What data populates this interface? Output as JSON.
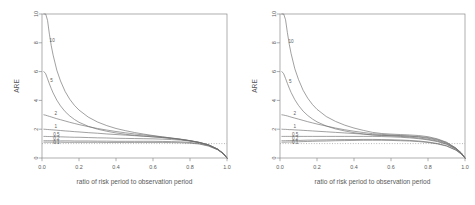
{
  "figure": {
    "panel_count": 2,
    "background": "#ffffff",
    "axis_color": "#8c8c8c",
    "curve_color": "#6e6e6e",
    "refline_color": "#9a9a9a"
  },
  "chart_data": [
    {
      "type": "line",
      "panel": "left",
      "title": "",
      "xlabel": "ratio of risk period to observation period",
      "ylabel": "ARE",
      "xlim": [
        0.0,
        1.0
      ],
      "ylim": [
        0.0,
        10.0
      ],
      "xticks": [
        0.0,
        0.2,
        0.4,
        0.6,
        0.8,
        1.0
      ],
      "xticklabels": [
        "0.0",
        "0.2",
        "0.4",
        "0.6",
        "0.8",
        "1.0"
      ],
      "yticks": [
        0,
        2,
        4,
        6,
        8,
        10
      ],
      "yticklabels": [
        "0",
        "2",
        "4",
        "6",
        "8",
        "10"
      ],
      "grid": false,
      "legend": "inline-curve-labels",
      "reference_lines": [
        {
          "axis": "y",
          "value": 1,
          "style": "dotted"
        }
      ],
      "x": [
        0.01,
        0.02,
        0.03,
        0.04,
        0.05,
        0.06,
        0.08,
        0.1,
        0.125,
        0.15,
        0.175,
        0.2,
        0.25,
        0.3,
        0.35,
        0.4,
        0.45,
        0.5,
        0.55,
        0.6,
        0.65,
        0.7,
        0.75,
        0.8,
        0.85,
        0.9,
        0.95,
        0.98,
        1.0
      ],
      "series": [
        {
          "name": "10",
          "label": "10",
          "label_x": 0.055,
          "label_y": 8.15,
          "values": [
            10.0,
            10.0,
            9.55,
            8.6,
            7.8,
            7.15,
            6.1,
            5.35,
            4.62,
            4.08,
            3.66,
            3.33,
            2.84,
            2.5,
            2.25,
            2.05,
            1.9,
            1.77,
            1.66,
            1.56,
            1.47,
            1.38,
            1.29,
            1.19,
            1.07,
            0.9,
            0.6,
            0.3,
            0.0
          ]
        },
        {
          "name": "5",
          "label": "5",
          "label_x": 0.052,
          "label_y": 5.35,
          "values": [
            6.0,
            5.85,
            5.5,
            5.15,
            4.82,
            4.52,
            4.02,
            3.62,
            3.22,
            2.92,
            2.68,
            2.48,
            2.2,
            2.0,
            1.86,
            1.74,
            1.65,
            1.58,
            1.52,
            1.47,
            1.42,
            1.36,
            1.29,
            1.2,
            1.08,
            0.91,
            0.61,
            0.31,
            0.0
          ]
        },
        {
          "name": "2",
          "label": "2",
          "label_x": 0.075,
          "label_y": 3.1,
          "values": [
            3.0,
            2.97,
            2.93,
            2.89,
            2.85,
            2.81,
            2.73,
            2.66,
            2.57,
            2.48,
            2.4,
            2.32,
            2.18,
            2.05,
            1.94,
            1.84,
            1.75,
            1.67,
            1.6,
            1.53,
            1.46,
            1.39,
            1.31,
            1.21,
            1.09,
            0.92,
            0.62,
            0.32,
            0.0
          ]
        },
        {
          "name": "1",
          "label": "1",
          "label_x": 0.075,
          "label_y": 2.22,
          "values": [
            2.0,
            1.99,
            1.98,
            1.97,
            1.96,
            1.95,
            1.93,
            1.91,
            1.88,
            1.86,
            1.83,
            1.81,
            1.76,
            1.72,
            1.67,
            1.63,
            1.59,
            1.55,
            1.51,
            1.47,
            1.42,
            1.36,
            1.29,
            1.2,
            1.08,
            0.91,
            0.61,
            0.31,
            0.0
          ]
        },
        {
          "name": "0.5",
          "label": "0.5",
          "label_x": 0.078,
          "label_y": 1.62,
          "values": [
            1.5,
            1.5,
            1.49,
            1.49,
            1.49,
            1.48,
            1.48,
            1.47,
            1.46,
            1.45,
            1.44,
            1.44,
            1.42,
            1.4,
            1.39,
            1.37,
            1.36,
            1.35,
            1.34,
            1.33,
            1.31,
            1.28,
            1.24,
            1.17,
            1.07,
            0.9,
            0.6,
            0.3,
            0.0
          ]
        },
        {
          "name": "0.2",
          "label": "0.2",
          "label_x": 0.078,
          "label_y": 1.35,
          "values": [
            1.2,
            1.2,
            1.2,
            1.2,
            1.2,
            1.2,
            1.19,
            1.19,
            1.19,
            1.19,
            1.18,
            1.18,
            1.18,
            1.17,
            1.17,
            1.16,
            1.16,
            1.16,
            1.16,
            1.16,
            1.15,
            1.14,
            1.12,
            1.08,
            1.0,
            0.85,
            0.58,
            0.29,
            0.0
          ]
        },
        {
          "name": "0.1",
          "label": "0.1",
          "label_x": 0.078,
          "label_y": 1.05,
          "values": [
            1.1,
            1.1,
            1.1,
            1.1,
            1.1,
            1.1,
            1.1,
            1.1,
            1.09,
            1.09,
            1.09,
            1.09,
            1.09,
            1.09,
            1.08,
            1.08,
            1.08,
            1.08,
            1.08,
            1.08,
            1.08,
            1.07,
            1.06,
            1.03,
            0.97,
            0.83,
            0.57,
            0.29,
            0.0
          ]
        }
      ]
    },
    {
      "type": "line",
      "panel": "right",
      "title": "",
      "xlabel": "ratio of risk period to observation period",
      "ylabel": "ARE",
      "xlim": [
        0.0,
        1.0
      ],
      "ylim": [
        0.0,
        10.0
      ],
      "xticks": [
        0.0,
        0.2,
        0.4,
        0.6,
        0.8,
        1.0
      ],
      "xticklabels": [
        "0.0",
        "0.2",
        "0.4",
        "0.6",
        "0.8",
        "1.0"
      ],
      "yticks": [
        0,
        2,
        4,
        6,
        8,
        10
      ],
      "yticklabels": [
        "0",
        "2",
        "4",
        "6",
        "8",
        "10"
      ],
      "grid": false,
      "legend": "inline-curve-labels",
      "reference_lines": [
        {
          "axis": "y",
          "value": 1,
          "style": "dotted"
        }
      ],
      "x": [
        0.01,
        0.02,
        0.03,
        0.04,
        0.05,
        0.06,
        0.08,
        0.1,
        0.125,
        0.15,
        0.175,
        0.2,
        0.25,
        0.3,
        0.35,
        0.4,
        0.45,
        0.5,
        0.55,
        0.6,
        0.65,
        0.7,
        0.75,
        0.8,
        0.85,
        0.9,
        0.95,
        0.98,
        1.0
      ],
      "series": [
        {
          "name": "10",
          "label": "10",
          "label_x": 0.06,
          "label_y": 8.1,
          "values": [
            10.0,
            10.0,
            9.6,
            8.7,
            7.9,
            7.25,
            6.2,
            5.45,
            4.7,
            4.15,
            3.72,
            3.38,
            2.88,
            2.54,
            2.28,
            2.08,
            1.92,
            1.78,
            1.7,
            1.66,
            1.63,
            1.6,
            1.56,
            1.48,
            1.33,
            1.1,
            0.7,
            0.35,
            0.0
          ]
        },
        {
          "name": "5",
          "label": "5",
          "label_x": 0.056,
          "label_y": 5.3,
          "values": [
            6.0,
            5.85,
            5.52,
            5.18,
            4.85,
            4.55,
            4.05,
            3.65,
            3.25,
            2.95,
            2.71,
            2.51,
            2.22,
            2.02,
            1.88,
            1.76,
            1.67,
            1.59,
            1.56,
            1.55,
            1.54,
            1.52,
            1.49,
            1.42,
            1.29,
            1.07,
            0.69,
            0.35,
            0.0
          ]
        },
        {
          "name": "2",
          "label": "2",
          "label_x": 0.08,
          "label_y": 3.08,
          "values": [
            3.0,
            2.98,
            2.95,
            2.92,
            2.88,
            2.84,
            2.77,
            2.7,
            2.61,
            2.52,
            2.44,
            2.36,
            2.22,
            2.08,
            1.96,
            1.86,
            1.77,
            1.69,
            1.64,
            1.6,
            1.56,
            1.52,
            1.46,
            1.37,
            1.24,
            1.03,
            0.67,
            0.34,
            0.0
          ]
        },
        {
          "name": "1",
          "label": "1",
          "label_x": 0.08,
          "label_y": 2.2,
          "values": [
            2.0,
            1.99,
            1.99,
            1.98,
            1.97,
            1.97,
            1.95,
            1.94,
            1.92,
            1.9,
            1.88,
            1.86,
            1.82,
            1.78,
            1.74,
            1.7,
            1.66,
            1.62,
            1.58,
            1.54,
            1.5,
            1.45,
            1.39,
            1.3,
            1.18,
            0.98,
            0.64,
            0.32,
            0.0
          ]
        },
        {
          "name": "0.5",
          "label": "0.5",
          "label_x": 0.082,
          "label_y": 1.64,
          "values": [
            1.5,
            1.5,
            1.5,
            1.5,
            1.5,
            1.5,
            1.5,
            1.5,
            1.5,
            1.5,
            1.5,
            1.5,
            1.5,
            1.5,
            1.5,
            1.5,
            1.5,
            1.5,
            1.49,
            1.47,
            1.44,
            1.4,
            1.34,
            1.26,
            1.14,
            0.95,
            0.62,
            0.31,
            0.0
          ]
        },
        {
          "name": "0.2",
          "label": "0.2",
          "label_x": 0.082,
          "label_y": 1.36,
          "values": [
            1.2,
            1.2,
            1.2,
            1.21,
            1.21,
            1.21,
            1.22,
            1.22,
            1.23,
            1.24,
            1.24,
            1.25,
            1.26,
            1.27,
            1.28,
            1.28,
            1.29,
            1.29,
            1.28,
            1.27,
            1.25,
            1.22,
            1.18,
            1.11,
            1.01,
            0.85,
            0.56,
            0.28,
            0.0
          ]
        },
        {
          "name": "0.1",
          "label": "0.1",
          "label_x": 0.082,
          "label_y": 1.06,
          "values": [
            1.1,
            1.1,
            1.1,
            1.11,
            1.11,
            1.11,
            1.12,
            1.13,
            1.14,
            1.15,
            1.16,
            1.17,
            1.18,
            1.2,
            1.21,
            1.22,
            1.23,
            1.23,
            1.23,
            1.22,
            1.2,
            1.18,
            1.14,
            1.08,
            0.98,
            0.83,
            0.55,
            0.28,
            0.0
          ]
        }
      ]
    }
  ]
}
